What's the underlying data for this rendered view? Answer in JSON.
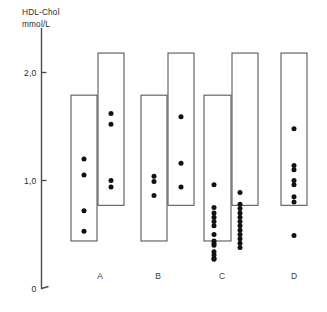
{
  "chart_data": {
    "type": "scatter",
    "title": "",
    "ylabel_line1": "HDL-Chol",
    "ylabel_line2": "mmol/L",
    "xlabel": "",
    "ylim": [
      0,
      2.3
    ],
    "yticks": [
      {
        "value": 0,
        "label": "0"
      },
      {
        "value": 1.0,
        "label": "1,0"
      },
      {
        "value": 2.0,
        "label": "2,0"
      }
    ],
    "grid": false,
    "legend": "none",
    "categories": [
      "A",
      "B",
      "C",
      "D"
    ],
    "groups": [
      {
        "label": "A",
        "label_x": 100,
        "boxes": [
          {
            "name": "box-a-left",
            "x": 71,
            "width": 26,
            "top_value": 1.79,
            "bottom_value": 0.44
          },
          {
            "name": "box-a-right",
            "x": 98,
            "width": 26,
            "top_value": 2.18,
            "bottom_value": 0.77
          }
        ],
        "series": [
          {
            "name": "A-left",
            "dot_x": 84,
            "values": [
              1.2,
              1.05,
              0.72,
              0.53
            ]
          },
          {
            "name": "A-right",
            "dot_x": 111,
            "values": [
              1.62,
              1.52,
              1.0,
              0.94
            ]
          }
        ]
      },
      {
        "label": "B",
        "label_x": 158,
        "boxes": [
          {
            "name": "box-b-left",
            "x": 141,
            "width": 26,
            "top_value": 1.79,
            "bottom_value": 0.44
          },
          {
            "name": "box-b-right",
            "x": 168,
            "width": 26,
            "top_value": 2.18,
            "bottom_value": 0.77
          }
        ],
        "series": [
          {
            "name": "B-left",
            "dot_x": 154,
            "values": [
              1.04,
              0.99,
              0.86
            ]
          },
          {
            "name": "B-right",
            "dot_x": 181,
            "values": [
              1.59,
              1.16,
              0.94
            ]
          }
        ]
      },
      {
        "label": "C",
        "label_x": 222,
        "boxes": [
          {
            "name": "box-c-left",
            "x": 204,
            "width": 27,
            "top_value": 1.79,
            "bottom_value": 0.44
          },
          {
            "name": "box-c-right",
            "x": 232,
            "width": 26,
            "top_value": 2.18,
            "bottom_value": 0.77
          }
        ],
        "series": [
          {
            "name": "C-left",
            "dot_x": 214,
            "values": [
              0.96,
              0.75,
              0.7,
              0.66,
              0.62,
              0.58,
              0.5,
              0.44,
              0.42,
              0.4,
              0.34,
              0.31,
              0.28,
              0.27
            ]
          },
          {
            "name": "C-right",
            "dot_x": 240,
            "values": [
              0.89,
              0.78,
              0.74,
              0.7,
              0.66,
              0.62,
              0.58,
              0.54,
              0.5,
              0.46,
              0.42,
              0.38
            ]
          }
        ]
      },
      {
        "label": "D",
        "label_x": 294,
        "boxes": [
          {
            "name": "box-d",
            "x": 281,
            "width": 26,
            "top_value": 2.18,
            "bottom_value": 0.77
          }
        ],
        "series": [
          {
            "name": "D",
            "dot_x": 294,
            "values": [
              1.48,
              1.14,
              1.1,
              1.0,
              0.96,
              0.85,
              0.8,
              0.49
            ]
          }
        ]
      }
    ]
  }
}
